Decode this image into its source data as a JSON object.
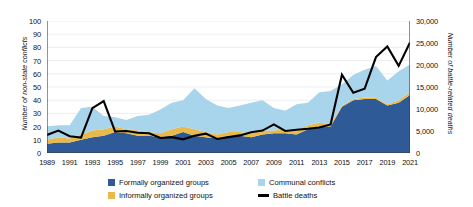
{
  "chart_data": {
    "type": "area",
    "title": "",
    "subtitle": "",
    "xlabel": "",
    "ylabel": "Number of non-state conflicts",
    "y2label": "Number of battle-related deaths",
    "ylim": [
      0,
      100
    ],
    "y2lim": [
      0,
      30000
    ],
    "grid": true,
    "legend_position": "bottom",
    "stacked": true,
    "x": [
      1989,
      1990,
      1991,
      1992,
      1993,
      1994,
      1995,
      1996,
      1997,
      1998,
      1999,
      2000,
      2001,
      2002,
      2003,
      2004,
      2005,
      2006,
      2007,
      2008,
      2009,
      2010,
      2011,
      2012,
      2013,
      2014,
      2015,
      2016,
      2017,
      2018,
      2019,
      2020,
      2021
    ],
    "x_tick_labels": [
      "1989",
      "1991",
      "1993",
      "1995",
      "1997",
      "1999",
      "2001",
      "2003",
      "2005",
      "2007",
      "2009",
      "2011",
      "2013",
      "2015",
      "2017",
      "2019",
      "2021"
    ],
    "y_tick_labels": [
      "0",
      "10",
      "20",
      "30",
      "40",
      "50",
      "60",
      "70",
      "80",
      "90",
      "100"
    ],
    "y2_tick_labels": [
      "0",
      "5,000",
      "10,000",
      "15,000",
      "20,000",
      "25,000",
      "30,000"
    ],
    "series": [
      {
        "name": "Formally organized groups",
        "color": "#2e5a98",
        "axis": "left",
        "type": "stacked-area",
        "values": [
          7,
          8,
          8,
          10,
          12,
          13,
          16,
          15,
          13,
          13,
          12,
          13,
          16,
          13,
          12,
          11,
          13,
          13,
          12,
          14,
          15,
          15,
          14,
          18,
          20,
          20,
          35,
          40,
          41,
          41,
          36,
          38,
          44
        ]
      },
      {
        "name": "Informally organized groups",
        "color": "#e9b94a",
        "axis": "left",
        "type": "stacked-area",
        "values": [
          3,
          4,
          3,
          4,
          5,
          5,
          4,
          3,
          4,
          3,
          3,
          5,
          4,
          5,
          4,
          3,
          3,
          3,
          3,
          3,
          2,
          3,
          3,
          3,
          3,
          2,
          1,
          1,
          1,
          1,
          1,
          2,
          2
        ]
      },
      {
        "name": "Communal conflicts",
        "color": "#a8d4ec",
        "axis": "left",
        "type": "stacked-area",
        "values": [
          10,
          9,
          10,
          20,
          18,
          10,
          7,
          7,
          11,
          13,
          18,
          20,
          20,
          31,
          25,
          22,
          18,
          20,
          23,
          23,
          17,
          14,
          20,
          17,
          23,
          25,
          16,
          18,
          21,
          24,
          18,
          22,
          21
        ]
      },
      {
        "name": "Battle deaths",
        "color": "#000000",
        "axis": "right",
        "type": "line",
        "values": [
          4100,
          5100,
          3800,
          3500,
          10200,
          11800,
          4900,
          5000,
          4600,
          4500,
          3400,
          3600,
          3100,
          3900,
          4400,
          3200,
          3600,
          4000,
          4700,
          5100,
          6500,
          5000,
          5300,
          5500,
          5800,
          6500,
          17800,
          13700,
          14600,
          21800,
          24200,
          19800,
          25100
        ]
      }
    ]
  },
  "legend": {
    "items": [
      {
        "label": "Formally organized groups",
        "marker": "square",
        "color": "#2e5a98"
      },
      {
        "label": "Communal conflicts",
        "marker": "square",
        "color": "#a8d4ec"
      },
      {
        "label": "Informally organized groups",
        "marker": "square",
        "color": "#e9b94a"
      },
      {
        "label": "Battle deaths",
        "marker": "line",
        "color": "#000000"
      }
    ]
  },
  "colors": {
    "formal": "#2e5a98",
    "informal": "#e9b94a",
    "communal": "#a8d4ec",
    "battle": "#000000",
    "grid": "#e3e7ea",
    "axis": "#3a3a3a"
  }
}
